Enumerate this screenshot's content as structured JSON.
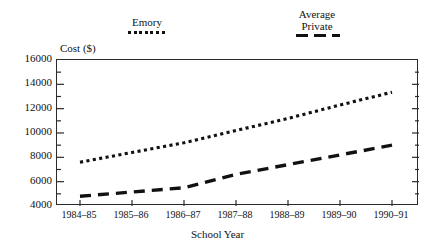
{
  "chart_data": {
    "type": "line",
    "title": "",
    "xlabel": "School Year",
    "ylabel": "Cost ($)",
    "categories": [
      "1984–85",
      "1985–86",
      "1986–87",
      "1987–88",
      "1988–89",
      "1989–90",
      "1990–91"
    ],
    "ylim": [
      4000,
      16000
    ],
    "ytick_labels": [
      "16000",
      "14000",
      "12000",
      "10000",
      "8000",
      "6000",
      "4000"
    ],
    "ytick_values": [
      16000,
      14000,
      12000,
      10000,
      8000,
      6000,
      4000
    ],
    "minor_tick_step": 1000,
    "grid": false,
    "legend_position": "above-plot",
    "series": [
      {
        "name": "Emory",
        "style": "dotted",
        "color": "#111111",
        "values": [
          7600,
          8400,
          9200,
          10200,
          11200,
          12300,
          13350
        ]
      },
      {
        "name": "Average Private",
        "style": "dashed",
        "color": "#111111",
        "values": [
          4800,
          5150,
          5500,
          6600,
          7400,
          8200,
          9000
        ]
      }
    ]
  },
  "legend": {
    "emory": {
      "label": "Emory",
      "style": "dotted"
    },
    "average_private": {
      "line1": "Average",
      "line2": "Private",
      "style": "dashed"
    }
  },
  "axis": {
    "y_title": "Cost ($)",
    "x_title": "School Year"
  }
}
